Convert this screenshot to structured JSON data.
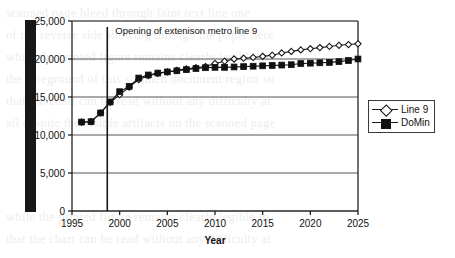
{
  "chart_data": {
    "type": "line",
    "title": "",
    "subtitle": "",
    "xlabel": "Year",
    "ylabel": "",
    "xlim": [
      1995,
      2025
    ],
    "ylim": [
      0,
      25000
    ],
    "xticks": [
      "1995",
      "2000",
      "2005",
      "2010",
      "2015",
      "2020",
      "2025"
    ],
    "yticks": [
      "0",
      "5,000",
      "10,000",
      "15,000",
      "20,000",
      "25,000"
    ],
    "grid": "horizontal",
    "legend_position": "right-outside",
    "x": [
      1996,
      1997,
      1998,
      1999,
      2000,
      2001,
      2002,
      2003,
      2004,
      2005,
      2006,
      2007,
      2008,
      2009,
      2010,
      2011,
      2012,
      2013,
      2014,
      2015,
      2016,
      2017,
      2018,
      2019,
      2020,
      2021,
      2022,
      2023,
      2024,
      2025
    ],
    "series": [
      {
        "name": "Line 9",
        "marker": "open-diamond",
        "values": [
          11700,
          11750,
          12900,
          14300,
          15300,
          16300,
          17300,
          17800,
          18100,
          18300,
          18500,
          18700,
          18850,
          19000,
          19400,
          19700,
          20000,
          20100,
          20200,
          20350,
          20500,
          20800,
          21000,
          21200,
          21350,
          21500,
          21650,
          21800,
          21900,
          22000
        ]
      },
      {
        "name": "DoMin",
        "marker": "filled-square",
        "values": [
          11700,
          11750,
          12900,
          14350,
          15700,
          16400,
          17500,
          17900,
          18150,
          18300,
          18450,
          18600,
          18750,
          18850,
          18900,
          18900,
          18950,
          19000,
          19050,
          19100,
          19150,
          19200,
          19250,
          19400,
          19450,
          19500,
          19550,
          19650,
          19800,
          20000
        ]
      }
    ],
    "annotations": [
      {
        "name": "metro-line-opening",
        "text": "Opening of extenison metro line 9",
        "x": 1998.7,
        "type": "vertical-line-with-label"
      }
    ],
    "colors": {
      "axis": "#111111",
      "gridline": "#555555",
      "line9": "#1a1a1a",
      "domin": "#101010",
      "annotation_line": "#151515",
      "background": "#ffffff"
    }
  },
  "legend": {
    "items": [
      {
        "label": "Line 9",
        "marker": "open-diamond"
      },
      {
        "label": "DoMin",
        "marker": "filled-square"
      }
    ]
  },
  "artifacts": {
    "scan_bar": "black-vertical-scan-bar",
    "ghost_text": [
      "scanned page bleed through faint text line one",
      "of the reverse side showing through the paper here",
      "while the printed figure remains clearly legible in",
      "the foreground of this scanned document region so",
      "that the chart can be read without any difficulty at",
      "all despite the visible artifacts on the scanned page"
    ]
  }
}
